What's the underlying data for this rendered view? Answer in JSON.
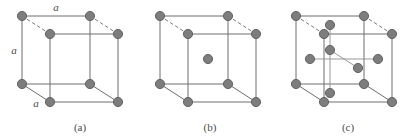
{
  "figure": {
    "background_color": "#ffffff",
    "edge_color": "#6e6e6e",
    "hidden_edge_color": "#7a7a7a",
    "atom_fill": "#7d7d7d",
    "atom_stroke": "#5a5a5a",
    "label_color": "#4a4a4a",
    "width": 420,
    "height": 137
  },
  "panels": [
    {
      "id": "a",
      "caption": "(a)",
      "lattice_type": "simple cubic",
      "atom_count": 8,
      "dimension_labels": [
        {
          "text": "a",
          "edge": "top-front-horizontal"
        },
        {
          "text": "a",
          "edge": "left-front-vertical"
        },
        {
          "text": "a",
          "edge": "bottom-left-depth"
        }
      ],
      "caption_x": 80,
      "caption_y": 130
    },
    {
      "id": "b",
      "caption": "(b)",
      "lattice_type": "body-centered cubic",
      "atom_count": 9,
      "dimension_labels": [],
      "caption_x": 210,
      "caption_y": 130
    },
    {
      "id": "c",
      "caption": "(c)",
      "lattice_type": "face-centered cubic",
      "atom_count": 14,
      "dimension_labels": [],
      "caption_x": 348,
      "caption_y": 130
    }
  ],
  "geometry": {
    "cube_front_left_x": 22,
    "cube_front_top_y": 16,
    "cube_side": 68,
    "depth_dx": 28,
    "depth_dy": -18,
    "panel_origins": [
      0,
      138,
      274
    ],
    "atom_radius_corner": 4.6,
    "atom_radius_interior": 4.6
  }
}
